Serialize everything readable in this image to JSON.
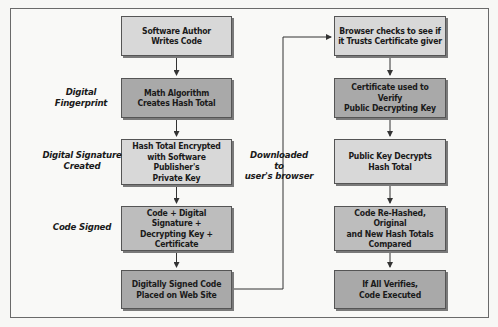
{
  "left_column": {
    "boxes": [
      {
        "text": "Software Author\nWrites Code"
      },
      {
        "text": "Math Algorithm\nCreates Hash Total"
      },
      {
        "text": "Hash Total Encrypted\nwith Software Publisher's\nPrivate Key"
      },
      {
        "text": "Code + Digital Signature +\nDecrypting Key +\nCertificate"
      },
      {
        "text": "Digitally Signed Code\nPlaced on Web Site"
      }
    ],
    "labels": [
      {
        "text": "Digital\nFingerprint"
      },
      {
        "text": "Digital Signature\nCreated"
      },
      {
        "text": "Code Signed"
      }
    ]
  },
  "right_column": {
    "boxes": [
      {
        "text": "Browser checks to see if\nit Trusts Certificate giver"
      },
      {
        "text": "Certificate used to Verify\nPublic Decrypting Key"
      },
      {
        "text": "Public Key Decrypts\nHash Total"
      },
      {
        "text": "Code Re-Hashed, Original\nand New Hash Totals\nCompared"
      },
      {
        "text": "If All Verifies,\nCode Executed"
      }
    ]
  },
  "connector_label": {
    "text": "Downloaded to\nuser's browser"
  },
  "colors": {
    "light_fill": "#d8d8d8",
    "mid_fill": "#bdbdbd",
    "dark_fill": "#a9a9a9",
    "line": "#333333"
  }
}
